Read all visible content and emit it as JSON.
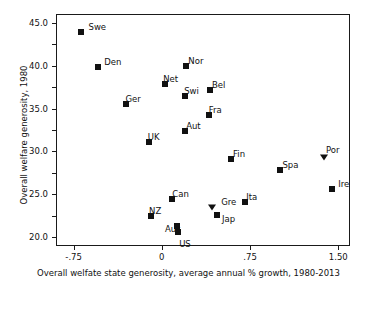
{
  "chart_data": {
    "type": "scatter",
    "title": "",
    "xlabel": "Overall welfate state generosity, average annual % growth, 1980-2013",
    "ylabel": "Overall welfare generosity, 1980",
    "xlim": [
      -0.9,
      1.6
    ],
    "ylim": [
      19.0,
      46.0
    ],
    "xticks": [
      -0.75,
      0,
      0.75,
      1.5
    ],
    "xticklabels": [
      "-.75",
      "0",
      ".75",
      "1.50"
    ],
    "yticks": [
      20.0,
      22.5,
      25.0,
      27.5,
      30.0,
      32.5,
      35.0,
      37.5,
      40.0,
      42.5,
      45.0
    ],
    "yticklabels": [
      "20.0",
      "22.5",
      "25.0",
      "27.5",
      "30.0",
      "32.5",
      "35.0",
      "37.5",
      "40.0",
      "42.5",
      "45.0"
    ],
    "grid": false,
    "legend": false,
    "marker_color": "#111111",
    "points": [
      {
        "label": "Swe",
        "x": -0.7,
        "y": 44.0,
        "marker": "square",
        "lx": 8,
        "ly": -9
      },
      {
        "label": "Den",
        "x": -0.55,
        "y": 39.9,
        "marker": "square",
        "lx": 6,
        "ly": -9
      },
      {
        "label": "Nor",
        "x": 0.2,
        "y": 40.1,
        "marker": "square",
        "lx": 2,
        "ly": -9
      },
      {
        "label": "Net",
        "x": 0.02,
        "y": 38.0,
        "marker": "square",
        "lx": -2,
        "ly": -9
      },
      {
        "label": "Swi",
        "x": 0.19,
        "y": 36.6,
        "marker": "square",
        "lx": -1,
        "ly": -9
      },
      {
        "label": "Bel",
        "x": 0.4,
        "y": 37.3,
        "marker": "square",
        "lx": 2,
        "ly": -9
      },
      {
        "label": "Ger",
        "x": -0.31,
        "y": 35.6,
        "marker": "square",
        "lx": -1,
        "ly": -9
      },
      {
        "label": "Fra",
        "x": 0.39,
        "y": 34.4,
        "marker": "square",
        "lx": 0,
        "ly": -9
      },
      {
        "label": "Aut",
        "x": 0.19,
        "y": 32.5,
        "marker": "square",
        "lx": 1,
        "ly": -9
      },
      {
        "label": "UK",
        "x": -0.12,
        "y": 31.2,
        "marker": "square",
        "lx": -1,
        "ly": -9
      },
      {
        "label": "Fin",
        "x": 0.58,
        "y": 29.2,
        "marker": "square",
        "lx": 2,
        "ly": -9
      },
      {
        "label": "Spa",
        "x": 1.0,
        "y": 28.0,
        "marker": "square",
        "lx": 2,
        "ly": -9
      },
      {
        "label": "Por",
        "x": 1.37,
        "y": 29.5,
        "marker": "triangle",
        "lx": 2,
        "ly": -11
      },
      {
        "label": "Ire",
        "x": 1.44,
        "y": 25.7,
        "marker": "square",
        "lx": 6,
        "ly": -9
      },
      {
        "label": "Can",
        "x": 0.08,
        "y": 24.6,
        "marker": "square",
        "lx": 0,
        "ly": -9
      },
      {
        "label": "Gre",
        "x": 0.42,
        "y": 23.6,
        "marker": "triangle",
        "lx": 9,
        "ly": -9
      },
      {
        "label": "Ita",
        "x": 0.7,
        "y": 24.2,
        "marker": "square",
        "lx": 1,
        "ly": -9
      },
      {
        "label": "Jap",
        "x": 0.46,
        "y": 22.7,
        "marker": "square",
        "lx": 5,
        "ly": 0
      },
      {
        "label": "NZ",
        "x": -0.1,
        "y": 22.6,
        "marker": "square",
        "lx": -2,
        "ly": -9
      },
      {
        "label": "Aus",
        "x": 0.12,
        "y": 21.5,
        "marker": "square",
        "lx": -12,
        "ly": -1
      },
      {
        "label": "US",
        "x": 0.13,
        "y": 20.7,
        "marker": "square",
        "lx": 1,
        "ly": 8
      }
    ]
  }
}
